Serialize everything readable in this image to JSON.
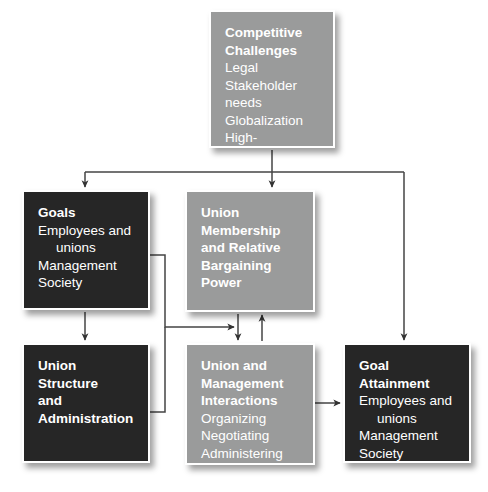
{
  "diagram": {
    "colors": {
      "gray_box": "#9a9b9b",
      "dark_box": "#262626",
      "text": "#ffffff",
      "connector": "#3a3a3a",
      "background": "#ffffff"
    },
    "nodes": [
      {
        "id": "competitive-challenges",
        "style": "gray",
        "title_lines": [
          "Competitive",
          "Challenges"
        ],
        "items": [
          "Legal",
          "Stakeholder needs",
          "Globalization"
        ],
        "wrapped_item": {
          "first": "High-performance",
          "second": "work systems"
        }
      },
      {
        "id": "goals",
        "style": "dark",
        "title_lines": [
          "Goals"
        ],
        "items": [
          "Management",
          "Society"
        ],
        "wrapped_item": {
          "first": "Employees and",
          "second": "unions"
        }
      },
      {
        "id": "union-membership",
        "style": "gray",
        "title_lines": [
          "Union",
          "Membership",
          "and Relative",
          "Bargaining",
          "Power"
        ],
        "items": []
      },
      {
        "id": "union-structure",
        "style": "dark",
        "title_lines": [
          "Union Structure",
          "and",
          "Administration"
        ],
        "items": []
      },
      {
        "id": "union-interactions",
        "style": "gray",
        "title_lines": [
          "Union and",
          "Management",
          "Interactions"
        ],
        "items": [
          "Organizing",
          "Negotiating",
          "Administering"
        ]
      },
      {
        "id": "goal-attainment",
        "style": "dark",
        "title_lines": [
          "Goal Attainment"
        ],
        "items": [
          "Management",
          "Society"
        ],
        "wrapped_item": {
          "first": "Employees and",
          "second": "unions"
        }
      }
    ],
    "connectors": [
      {
        "from": "competitive-challenges",
        "to": "goals",
        "kind": "arrow-down"
      },
      {
        "from": "competitive-challenges",
        "to": "union-membership",
        "kind": "arrow-down"
      },
      {
        "from": "competitive-challenges",
        "to": "goal-attainment",
        "kind": "arrow-down"
      },
      {
        "from": "goals",
        "to": "union-structure",
        "kind": "arrow-down"
      },
      {
        "from": "union-membership",
        "to": "union-interactions",
        "kind": "arrow-down"
      },
      {
        "from": "union-interactions",
        "to": "union-membership",
        "kind": "arrow-up"
      },
      {
        "from": "goals",
        "to": "union-interactions",
        "kind": "arrow-right-elbow"
      },
      {
        "from": "union-structure",
        "to": "union-interactions",
        "kind": "arrow-right-elbow"
      },
      {
        "from": "union-interactions",
        "to": "goal-attainment",
        "kind": "arrow-right"
      }
    ]
  }
}
